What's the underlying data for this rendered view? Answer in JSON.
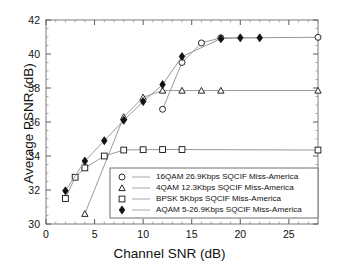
{
  "chart_data": {
    "type": "line",
    "title": "",
    "xlabel": "Channel SNR (dB)",
    "ylabel": "Average PSNR (dB)",
    "xlim": [
      0,
      28
    ],
    "ylim": [
      30,
      42
    ],
    "xticks": [
      0,
      5,
      10,
      15,
      20,
      25
    ],
    "yticks": [
      30,
      32,
      34,
      36,
      38,
      40,
      42
    ],
    "xtick_labels": [
      "0",
      "5",
      "10",
      "15",
      "20",
      "25"
    ],
    "ytick_labels": [
      "30",
      "32",
      "34",
      "36",
      "38",
      "40",
      "42"
    ],
    "grid": false,
    "legend_position": "lower-right-inside",
    "series": [
      {
        "name": "16QAM 26.9Kbps SQCIF Miss-America",
        "marker": "open-circle",
        "color": "#111111",
        "x": [
          12,
          14,
          16,
          18,
          28
        ],
        "y": [
          36.75,
          39.5,
          40.65,
          40.95,
          40.98
        ]
      },
      {
        "name": "4QAM 12.3Kbps SQCIF Miss-America",
        "marker": "open-triangle",
        "color": "#111111",
        "x": [
          4,
          8,
          10,
          12,
          14,
          16,
          18,
          28
        ],
        "y": [
          30.6,
          36.3,
          37.45,
          37.85,
          37.85,
          37.85,
          37.85,
          37.85
        ]
      },
      {
        "name": "BPSK 5Kbps SQCIF Miss-America",
        "marker": "open-square",
        "color": "#111111",
        "x": [
          2,
          3,
          4,
          6,
          8,
          10,
          12,
          14,
          28
        ],
        "y": [
          31.5,
          32.75,
          33.3,
          34.0,
          34.35,
          34.37,
          34.38,
          34.38,
          34.35
        ]
      },
      {
        "name": "AQAM 5-26.9Kbps SQCIF Miss-America",
        "marker": "filled-diamond",
        "color": "#111111",
        "x": [
          2,
          4,
          6,
          8,
          10,
          12,
          14,
          18,
          20,
          22
        ],
        "y": [
          31.95,
          33.7,
          34.9,
          36.1,
          37.2,
          38.2,
          39.85,
          40.9,
          40.95,
          40.95
        ]
      }
    ]
  },
  "legend": {
    "entries": [
      "16QAM 26.9Kbps SQCIF Miss-America",
      "4QAM 12.3Kbps SQCIF Miss-America",
      "BPSK 5Kbps SQCIF Miss-America",
      "AQAM 5-26.9Kbps SQCIF Miss-America"
    ]
  }
}
